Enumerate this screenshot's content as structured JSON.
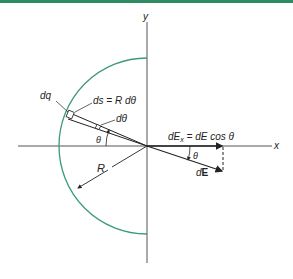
{
  "colors": {
    "top_bar": "#2e8b62",
    "arc": "#3a9a7a",
    "lines": "#222222",
    "axis": "#555555"
  },
  "labels": {
    "y_axis": "y",
    "x_axis": "x",
    "dq": "dq",
    "ds": "ds = R dθ",
    "dtheta": "dθ",
    "theta_left": "θ",
    "theta_right": "θ",
    "dEx": "dEx = dE cos θ",
    "dEx_main": "dE",
    "dEx_sub": "x",
    "dEx_rest": " = dE cos θ",
    "dE_prefix": "d",
    "dE_bold": "E",
    "R": "R"
  }
}
